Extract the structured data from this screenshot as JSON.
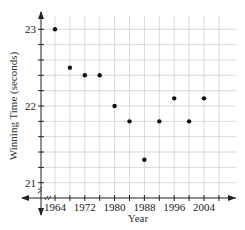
{
  "chart_data": {
    "type": "scatter",
    "title": "",
    "xlabel": "Year",
    "ylabel": "Winning Time (seconds)",
    "x": [
      1964,
      1968,
      1972,
      1976,
      1980,
      1984,
      1988,
      1992,
      1996,
      2000,
      2004
    ],
    "y": [
      23.0,
      22.5,
      22.4,
      22.4,
      22.0,
      21.8,
      21.3,
      21.8,
      22.1,
      21.8,
      22.1
    ],
    "series": [
      {
        "name": "Winning Time",
        "x": [
          1964,
          1968,
          1972,
          1976,
          1980,
          1984,
          1988,
          1992,
          1996,
          2000,
          2004
        ],
        "values": [
          23.0,
          22.5,
          22.4,
          22.4,
          22.0,
          21.8,
          21.3,
          21.8,
          22.1,
          21.8,
          22.1
        ]
      }
    ],
    "x_tick_labels": [
      "1964",
      "1972",
      "1980",
      "1988",
      "1996",
      "2004"
    ],
    "y_tick_labels": [
      "21",
      "22",
      "23"
    ],
    "xlim": [
      1960,
      2012
    ],
    "ylim": [
      20.7,
      23.2
    ],
    "x_grid_step": 4,
    "y_grid_step": 0.2,
    "grid": true,
    "axis_break": true,
    "legend": "none"
  }
}
